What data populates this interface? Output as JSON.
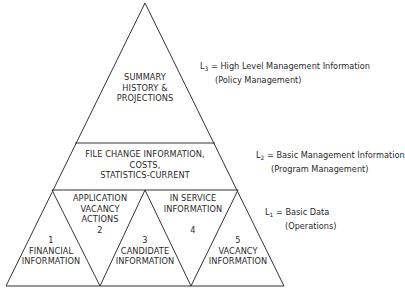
{
  "diagram": {
    "type": "pyramid",
    "levels": [
      {
        "id": "L3",
        "label": "L",
        "sub": "3",
        "eq": "= High Level Management Information",
        "note": "(Policy Management)",
        "content": [
          "SUMMARY",
          "HISTORY &",
          "PROJECTIONS"
        ]
      },
      {
        "id": "L2",
        "label": "L",
        "sub": "2",
        "eq": "= Basic Management Information",
        "note": "(Program Management)",
        "content": [
          "FILE CHANGE INFORMATION,",
          "COSTS,",
          "STATISTICS-CURRENT"
        ]
      },
      {
        "id": "L1",
        "label": "L",
        "sub": "1",
        "eq": "= Basic Data",
        "note": "(Operations)"
      }
    ],
    "segments": [
      {
        "number": "1",
        "lines": [
          "FINANCIAL",
          "INFORMATION"
        ]
      },
      {
        "number": "2",
        "lines": [
          "APPLICATION",
          "VACANCY",
          "ACTIONS"
        ]
      },
      {
        "number": "3",
        "lines": [
          "CANDIDATE",
          "INFORMATION"
        ]
      },
      {
        "number": "4",
        "lines": [
          "IN SERVICE",
          "INFORMATION"
        ]
      },
      {
        "number": "5",
        "lines": [
          "VACANCY",
          "INFORMATION"
        ]
      }
    ],
    "line_color": "#333333"
  }
}
